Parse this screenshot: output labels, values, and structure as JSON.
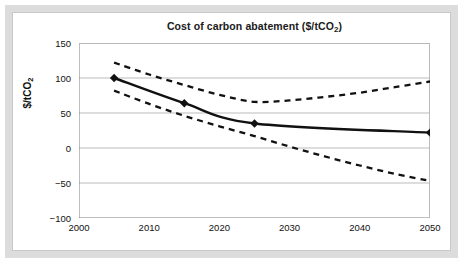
{
  "chart_data": {
    "type": "line",
    "title": "Cost of carbon abatement ($/tCO2)",
    "title_main": "Cost of carbon abatement ($/tCO",
    "title_sub": "2",
    "title_tail": ")",
    "xlabel": "",
    "ylabel": "$/tCO",
    "ylabel_sub": "2",
    "xlim": [
      2000,
      2050
    ],
    "ylim": [
      -100,
      150
    ],
    "xticks": [
      2000,
      2010,
      2020,
      2030,
      2040,
      2050
    ],
    "yticks": [
      150,
      100,
      50,
      0,
      -50,
      -100
    ],
    "grid": "horizontal",
    "legend": "none",
    "series": [
      {
        "name": "Central estimate",
        "style": "solid",
        "marker": "diamond",
        "color": "#111111",
        "x": [
          2005,
          2015,
          2025,
          2050
        ],
        "values": [
          100,
          64,
          35,
          22
        ]
      },
      {
        "name": "Upper bound",
        "style": "dashed",
        "marker": "none",
        "color": "#111111",
        "x": [
          2005,
          2010,
          2015,
          2020,
          2025,
          2030,
          2035,
          2040,
          2045,
          2050
        ],
        "values": [
          122,
          105,
          90,
          76,
          66,
          68,
          73,
          79,
          87,
          95
        ]
      },
      {
        "name": "Lower bound",
        "style": "dashed",
        "marker": "none",
        "color": "#111111",
        "x": [
          2005,
          2010,
          2015,
          2020,
          2025,
          2030,
          2035,
          2040,
          2045,
          2050
        ],
        "values": [
          82,
          63,
          46,
          31,
          17,
          2,
          -12,
          -25,
          -37,
          -47
        ]
      }
    ]
  },
  "axis": {
    "ytick_labels": [
      "150",
      "100",
      "50",
      "0",
      "−50",
      "−100"
    ],
    "xtick_labels": [
      "2000",
      "2010",
      "2020",
      "2030",
      "2040",
      "2050"
    ]
  },
  "colors": {
    "frame": "#dcdcdc",
    "inner_border": "#c8c8c8",
    "grid": "#b3b3b3",
    "axis": "#7f7f7f",
    "line": "#111111",
    "background": "#ffffff"
  }
}
